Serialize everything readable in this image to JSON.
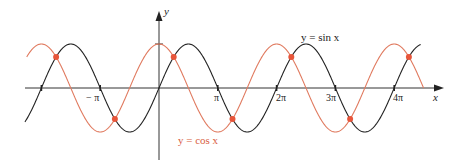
{
  "chart_data": {
    "type": "line",
    "title": "",
    "xlabel": "x",
    "ylabel": "y",
    "x_range": [
      -2.3,
      4.6
    ],
    "x_unit": "pi",
    "ylim": [
      -1,
      1
    ],
    "grid": false,
    "tick_labels": [
      "−π",
      "π",
      "2π",
      "3π",
      "4π"
    ],
    "series": [
      {
        "name": "y = sin x",
        "color": "#222222",
        "function": "sin"
      },
      {
        "name": "y = cos x",
        "color": "#e07a5f",
        "function": "cos"
      }
    ],
    "intersections_x_over_pi": [
      -1.75,
      -0.75,
      0.25,
      1.25,
      2.25,
      3.25,
      4.25
    ],
    "intersection_color": "#e8553a"
  },
  "labels": {
    "y_axis": "y",
    "x_axis": "x",
    "sin": "y  =  sin  x",
    "cos": "y  =  cos  x",
    "neg_pi": "− π",
    "pi": "π",
    "two_pi": "2π",
    "three_pi": "3π",
    "four_pi": "4π"
  }
}
